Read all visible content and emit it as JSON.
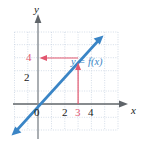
{
  "figure": {
    "type": "graph"
  },
  "axes": {
    "x_axis_label": "x",
    "y_axis_label": "y",
    "x_ticks": [
      {
        "label": "0",
        "value": 0,
        "highlight": false
      },
      {
        "label": "2",
        "value": 2,
        "highlight": false
      },
      {
        "label": "3",
        "value": 3,
        "highlight": true
      },
      {
        "label": "4",
        "value": 4,
        "highlight": false
      }
    ],
    "y_ticks": [
      {
        "label": "2",
        "value": 2,
        "highlight": false
      },
      {
        "label": "4",
        "value": 4,
        "highlight": true
      }
    ],
    "xlim": [
      -2,
      6
    ],
    "ylim": [
      -2,
      6
    ],
    "grid": true
  },
  "curve": {
    "label": "y = f(x)",
    "color": "#3a85c6",
    "slope": 1.5,
    "intercept": -0.5,
    "arrows": "both-ends"
  },
  "annotations": {
    "vertical_arrow": {
      "from_x": 3,
      "from_y": 0,
      "to_x": 3,
      "to_y": 4,
      "color": "#e2566f",
      "direction": "up"
    },
    "horizontal_arrow": {
      "from_x": 3,
      "from_y": 4,
      "to_x": 0,
      "to_y": 4,
      "color": "#e2566f",
      "direction": "left"
    }
  },
  "colors": {
    "curve": "#3a85c6",
    "annotation": "#e2566f",
    "grid": "#cfd8e4",
    "axis": "#6f7479",
    "text": "#1a1a1a"
  }
}
